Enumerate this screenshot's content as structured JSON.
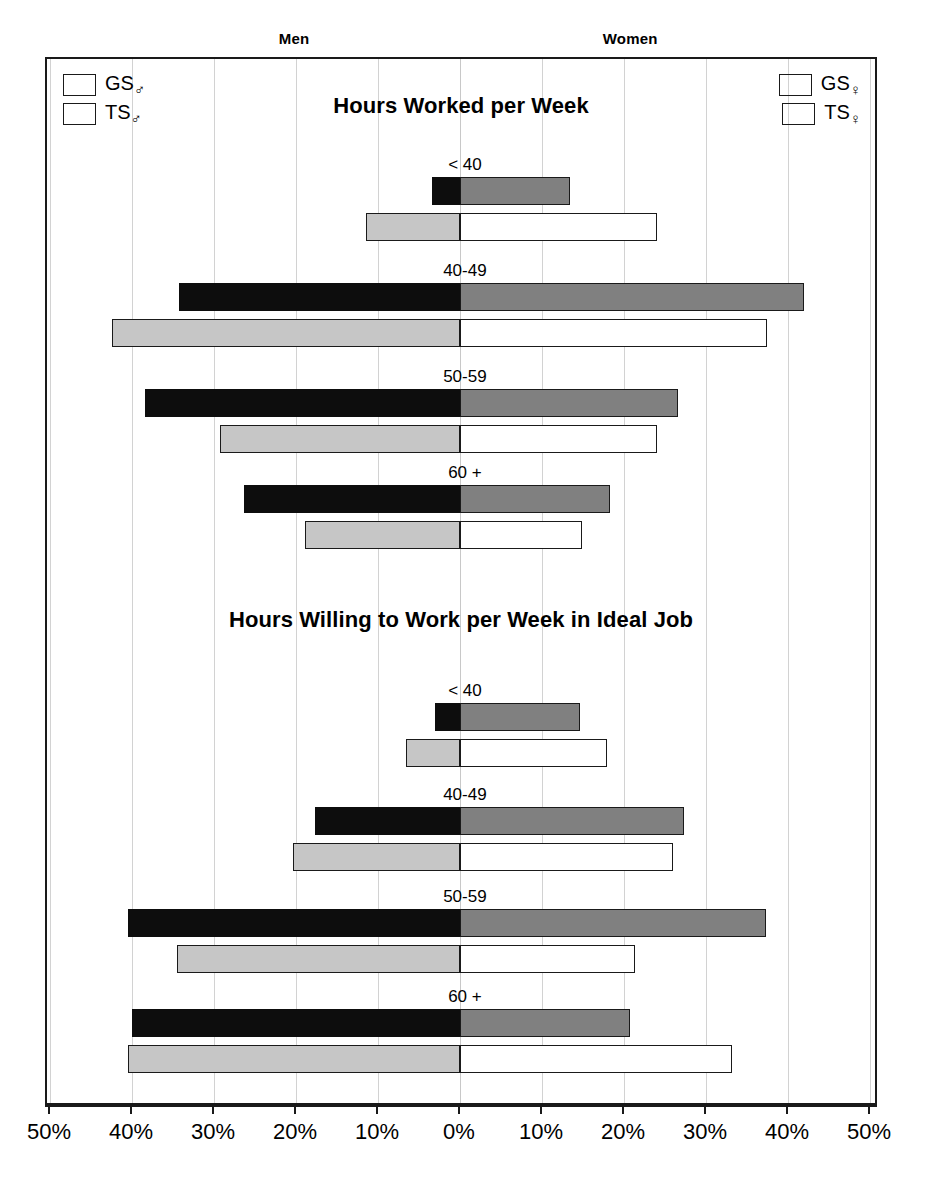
{
  "header": {
    "men_label": "Men",
    "women_label": "Women"
  },
  "legend_men": {
    "items": [
      {
        "name": "GS",
        "symbol": "♂",
        "swatch": "gs-m",
        "color": "#0d0d0d"
      },
      {
        "name": "TS",
        "symbol": "♂",
        "swatch": "ts-m",
        "color": "#c6c6c6"
      }
    ]
  },
  "legend_women": {
    "items": [
      {
        "name": "GS",
        "symbol": "♀",
        "swatch": "gs-f",
        "color": "#808080"
      },
      {
        "name": "TS",
        "symbol": "♀",
        "swatch": "ts-f",
        "color": "#ffffff"
      }
    ]
  },
  "axis": {
    "tick_labels": [
      "50%",
      "40%",
      "30%",
      "20%",
      "10%",
      "0%",
      "10%",
      "20%",
      "30%",
      "40%",
      "50%"
    ],
    "tick_values": [
      -50,
      -40,
      -30,
      -20,
      -10,
      0,
      10,
      20,
      30,
      40,
      50
    ],
    "min": -50,
    "max": 50
  },
  "chart_data": [
    {
      "type": "bar",
      "orientation": "horizontal",
      "layout": "diverging-population-pyramid",
      "title": "Hours Worked per Week",
      "xlabel": "",
      "ylabel": "",
      "xlim": [
        -50,
        50
      ],
      "grid": true,
      "legend_position": "top-left and top-right",
      "categories": [
        "< 40",
        "40-49",
        "50-59",
        "60 +"
      ],
      "series": [
        {
          "name": "GS♂",
          "side": "left",
          "color": "#0d0d0d",
          "values": [
            3.4,
            34.3,
            38.4,
            26.3
          ]
        },
        {
          "name": "TS♂",
          "side": "left",
          "color": "#c6c6c6",
          "values": [
            11.5,
            42.4,
            29.3,
            18.9
          ]
        },
        {
          "name": "GS♀",
          "side": "right",
          "color": "#808080",
          "values": [
            13.4,
            41.9,
            26.6,
            18.3
          ]
        },
        {
          "name": "TS♀",
          "side": "right",
          "color": "#ffffff",
          "values": [
            24.0,
            37.4,
            24.0,
            14.9
          ]
        }
      ]
    },
    {
      "type": "bar",
      "orientation": "horizontal",
      "layout": "diverging-population-pyramid",
      "title": "Hours Willing to Work per Week in Ideal Job",
      "xlabel": "",
      "ylabel": "",
      "xlim": [
        -50,
        50
      ],
      "grid": true,
      "legend_position": "shared with upper panel",
      "categories": [
        "< 40",
        "40-49",
        "50-59",
        "60 +"
      ],
      "series": [
        {
          "name": "GS♂",
          "side": "left",
          "color": "#0d0d0d",
          "values": [
            3.0,
            17.7,
            40.5,
            40.0
          ]
        },
        {
          "name": "TS♂",
          "side": "left",
          "color": "#c6c6c6",
          "values": [
            6.6,
            20.4,
            34.5,
            40.5
          ]
        },
        {
          "name": "GS♀",
          "side": "right",
          "color": "#808080",
          "values": [
            14.6,
            27.3,
            37.3,
            20.7
          ]
        },
        {
          "name": "TS♀",
          "side": "right",
          "color": "#ffffff",
          "values": [
            17.9,
            26.0,
            21.3,
            33.2
          ]
        }
      ]
    }
  ],
  "panels": [
    {
      "title": "Hours Worked per Week",
      "title_top": 34,
      "groups": [
        {
          "label": "< 40",
          "label_top": 96,
          "row_top": 118
        },
        {
          "label": "40-49",
          "label_top": 202,
          "row_top": 224
        },
        {
          "label": "50-59",
          "label_top": 308,
          "row_top": 330
        },
        {
          "label": "60 +",
          "label_top": 404,
          "row_top": 426
        }
      ]
    },
    {
      "title": "Hours Willing to Work per Week in Ideal Job",
      "title_top": 548,
      "groups": [
        {
          "label": "< 40",
          "label_top": 622,
          "row_top": 644
        },
        {
          "label": "40-49",
          "label_top": 726,
          "row_top": 748
        },
        {
          "label": "50-59",
          "label_top": 828,
          "row_top": 850
        },
        {
          "label": "60 +",
          "label_top": 928,
          "row_top": 950
        }
      ]
    }
  ]
}
